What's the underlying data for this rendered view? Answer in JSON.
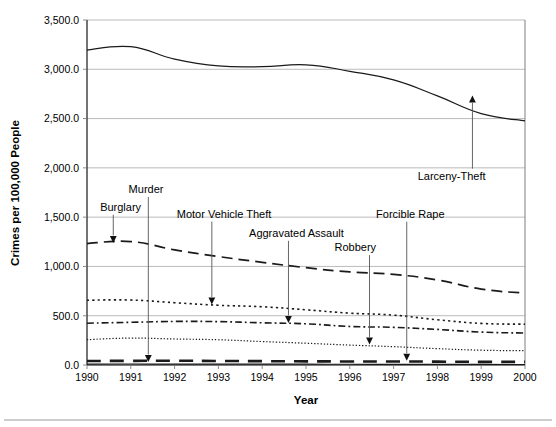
{
  "chart_data": {
    "type": "line",
    "title": "",
    "xlabel": "Year",
    "ylabel": "Crimes per 100,000 People",
    "x": [
      1990,
      1991,
      1992,
      1993,
      1994,
      1995,
      1996,
      1997,
      1998,
      1999,
      2000
    ],
    "xtick_labels": [
      "1990",
      "1991",
      "1992",
      "1993",
      "1994",
      "1995",
      "1996",
      "1997",
      "1998",
      "1999",
      "2000"
    ],
    "ytick_labels": [
      "0.0",
      "500.0",
      "1,000.0",
      "1,500.0",
      "2,000.0",
      "2,500.0",
      "3,000.0",
      "3,500.0"
    ],
    "ytick_values": [
      0,
      500,
      1000,
      1500,
      2000,
      2500,
      3000,
      3500
    ],
    "ylim": [
      0,
      3500
    ],
    "xlim": [
      1990,
      2000
    ],
    "grid": "horizontal",
    "legend": "none (direct annotations with leader lines)",
    "series": [
      {
        "name": "Larceny-Theft",
        "style": "solid",
        "values": [
          3195,
          3229,
          3103,
          3034,
          3026,
          3045,
          2980,
          2892,
          2730,
          2551,
          2477
        ]
      },
      {
        "name": "Burglary",
        "style": "long-dash",
        "values": [
          1232,
          1252,
          1168,
          1100,
          1042,
          987,
          944,
          919,
          863,
          770,
          729
        ]
      },
      {
        "name": "Motor Vehicle Theft",
        "style": "dotted-square",
        "values": [
          657,
          659,
          632,
          606,
          591,
          560,
          526,
          506,
          459,
          422,
          414
        ]
      },
      {
        "name": "Aggravated Assault",
        "style": "dash-dot",
        "values": [
          424,
          433,
          442,
          440,
          428,
          418,
          391,
          382,
          361,
          334,
          324
        ]
      },
      {
        "name": "Robbery",
        "style": "fine-dotted",
        "values": [
          257,
          273,
          264,
          256,
          238,
          221,
          202,
          186,
          166,
          150,
          145
        ]
      },
      {
        "name": "Forcible Rape",
        "style": "thick-dash",
        "values": [
          41,
          42,
          43,
          41,
          39,
          37,
          36,
          36,
          34,
          32,
          32
        ]
      },
      {
        "name": "Murder",
        "style": "near-zero",
        "values": [
          9.4,
          9.8,
          9.3,
          9.5,
          9.0,
          8.2,
          7.4,
          6.8,
          6.3,
          5.7,
          5.5
        ]
      }
    ],
    "annotations": [
      {
        "label": "Larceny-Theft",
        "label_x": 1997.55,
        "label_y": 1880,
        "point_x": 1998.8,
        "point_y": 2730
      },
      {
        "label": "Burglary",
        "label_x": 1990.3,
        "label_y": 1565,
        "point_x": 1990.6,
        "point_y": 1244
      },
      {
        "label": "Murder",
        "label_x": 1990.95,
        "label_y": 1745,
        "point_x": 1991.4,
        "point_y": 35
      },
      {
        "label": "Motor Vehicle Theft",
        "label_x": 1992.05,
        "label_y": 1495,
        "point_x": 1992.85,
        "point_y": 618
      },
      {
        "label": "Aggravated Assault",
        "label_x": 1993.7,
        "label_y": 1300,
        "point_x": 1994.6,
        "point_y": 432
      },
      {
        "label": "Robbery",
        "label_x": 1995.65,
        "label_y": 1155,
        "point_x": 1996.45,
        "point_y": 212
      },
      {
        "label": "Forcible Rape",
        "label_x": 1996.6,
        "label_y": 1495,
        "point_x": 1997.3,
        "point_y": 48
      }
    ]
  }
}
